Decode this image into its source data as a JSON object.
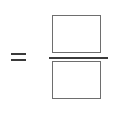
{
  "expression": {
    "operator": "=",
    "fraction": {
      "numerator": {
        "value": "",
        "placeholder": ""
      },
      "denominator": {
        "value": "",
        "placeholder": ""
      }
    }
  },
  "colors": {
    "line": "#3a3a3a",
    "box_border": "#6e6e6e",
    "background": "#ffffff"
  }
}
